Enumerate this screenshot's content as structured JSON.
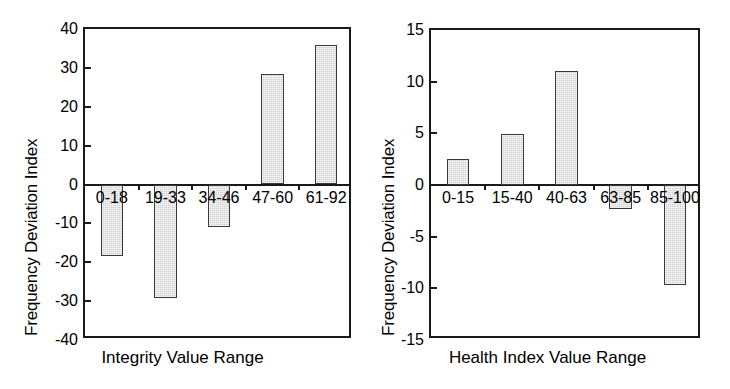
{
  "chart_data": [
    {
      "type": "bar",
      "panel": "left",
      "title": "",
      "xlabel": "Integrity Value Range",
      "ylabel": "Frequency Deviation Index",
      "categories": [
        "0-18",
        "19-33",
        "34-46",
        "47-60",
        "61-92"
      ],
      "values": [
        -18.5,
        -29.3,
        -11,
        28.5,
        36
      ],
      "ylim": [
        -40,
        40
      ],
      "yticks": [
        "40",
        "30",
        "20",
        "10",
        "0",
        "-10",
        "-20",
        "-30",
        "-40"
      ],
      "ytick_values": [
        40,
        30,
        20,
        10,
        0,
        -10,
        -20,
        -30,
        -40
      ],
      "grid": false,
      "legend": "none",
      "bar_color": "#d2d2d2",
      "bar_edge_color": "#3a3a3a",
      "axis_color": "#1a1a1a"
    },
    {
      "type": "bar",
      "panel": "right",
      "title": "",
      "xlabel": "Health Index Value Range",
      "ylabel": "Frequency Deviation Index",
      "categories": [
        "0-15",
        "15-40",
        "40-63",
        "63-85",
        "85-100"
      ],
      "values": [
        2.5,
        4.9,
        11,
        -2.3,
        -9.7
      ],
      "ylim": [
        -15,
        15
      ],
      "yticks": [
        "15",
        "10",
        "5",
        "0",
        "-5",
        "-10",
        "-15"
      ],
      "ytick_values": [
        15,
        10,
        5,
        0,
        -5,
        -10,
        -15
      ],
      "grid": false,
      "legend": "none",
      "bar_color": "#d2d2d2",
      "bar_edge_color": "#3a3a3a",
      "axis_color": "#1a1a1a"
    }
  ]
}
